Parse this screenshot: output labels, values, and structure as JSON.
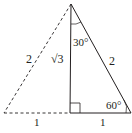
{
  "diagram": {
    "type": "geometry",
    "colors": {
      "stroke": "#231f20",
      "background": "#ffffff"
    },
    "vertices": {
      "apex": [
        71,
        4
      ],
      "left": [
        4,
        113
      ],
      "foot": [
        70,
        113
      ],
      "right": [
        131,
        113
      ]
    },
    "labels": {
      "left_side": "2",
      "altitude": "√3",
      "hypotenuse": "2",
      "angle_top": "30°",
      "angle_right": "60°",
      "base_left": "1",
      "base_right": "1"
    },
    "right_angle_marker": true,
    "dashed_sides": [
      "apex-left",
      "left-foot"
    ],
    "solid_sides": [
      "apex-foot",
      "foot-right",
      "right-apex"
    ]
  }
}
